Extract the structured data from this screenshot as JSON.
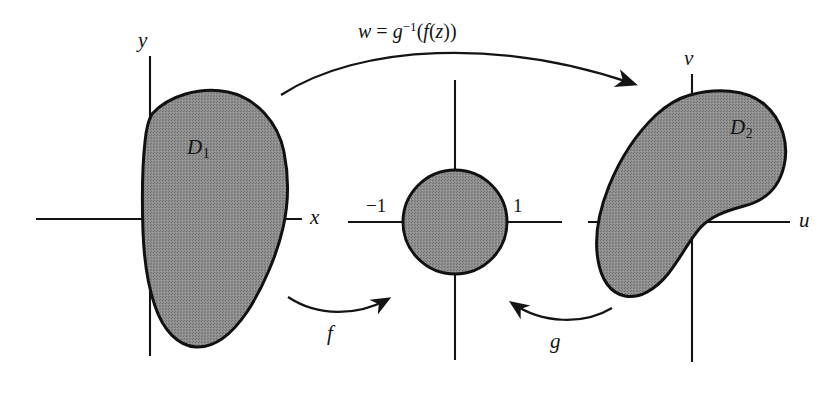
{
  "figure": {
    "kind": "mathematical-diagram",
    "topic": "conformal-mapping-composition",
    "width": 834,
    "height": 402,
    "background_color": "#ffffff",
    "ink_color": "#141414",
    "region_fill_color": "#8a8a8a",
    "region_stroke_color": "#111111"
  },
  "top_equation": {
    "full_text": "w = g⁻¹(f(z))",
    "w": "w",
    "equals": "=",
    "g": "g",
    "exponent": "−1",
    "open_paren": "(",
    "f": "f",
    "inner_open_paren": "(",
    "z": "z",
    "inner_close_paren": ")",
    "close_paren": ")"
  },
  "panels": {
    "left": {
      "name": "z-plane",
      "horizontal_axis_label": "x",
      "vertical_axis_label": "y",
      "region_label_base": "D",
      "region_label_subscript": "1",
      "region_label_full": "D₁"
    },
    "middle": {
      "name": "unit-disk-plane",
      "tick_left": "−1",
      "tick_right": "1"
    },
    "right": {
      "name": "w-plane",
      "horizontal_axis_label": "u",
      "vertical_axis_label": "v",
      "region_label_base": "D",
      "region_label_subscript": "2",
      "region_label_full": "D₂"
    }
  },
  "maps": {
    "forward": {
      "label": "f",
      "direction": "left-to-middle",
      "description": "maps D₁ onto the unit disk"
    },
    "backward": {
      "label": "g",
      "direction": "right-to-middle",
      "description": "maps D₂ onto the unit disk"
    },
    "composite": {
      "label": "w = g⁻¹(f(z))",
      "direction": "left-to-right",
      "description": "composite map from D₁ onto D₂"
    }
  }
}
